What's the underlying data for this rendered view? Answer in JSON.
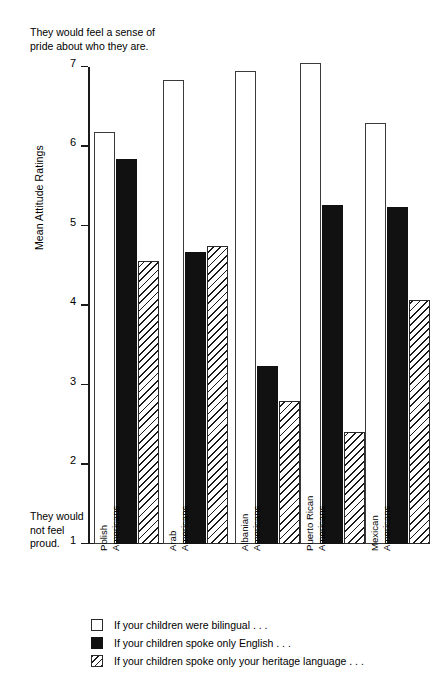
{
  "annotations": {
    "top_caption": "They would feel a sense of\npride about who they are.",
    "bottom_caption": "They would\nnot feel\nproud."
  },
  "chart_data": {
    "type": "bar",
    "title": "",
    "xlabel": "",
    "ylabel": "Mean Attitude Ratings",
    "ylim": [
      1,
      7
    ],
    "yticks": [
      "7",
      "6",
      "5",
      "4",
      "3",
      "2",
      "1"
    ],
    "grid": false,
    "legend_position": "bottom-left",
    "categories": [
      "Polish\nAmericans",
      "Arab\nAmericans",
      "Albanian\nAmericans",
      "Puerto Rican\nAmericans",
      "Mexican\nAmericans"
    ],
    "series": [
      {
        "name": "If your children were bilingual . . .",
        "fill": "white",
        "values": [
          6.18,
          6.84,
          6.95,
          7.05,
          6.3
        ]
      },
      {
        "name": "If your children spoke only English . . .",
        "fill": "black",
        "values": [
          5.84,
          4.67,
          3.24,
          5.26,
          5.24
        ]
      },
      {
        "name": "If your children spoke only your heritage language . . .",
        "fill": "hatch",
        "values": [
          4.56,
          4.75,
          2.8,
          2.41,
          4.07
        ]
      }
    ],
    "annotations": {
      "top_caption": "They would feel a sense of pride about who they are.",
      "bottom_caption": "They would not feel proud."
    }
  },
  "colors": {
    "axis": "#1a1a1a",
    "bar_white": "#ffffff",
    "bar_black": "#111111",
    "bar_hatch": "#1a1a1a",
    "background": "#ffffff"
  }
}
